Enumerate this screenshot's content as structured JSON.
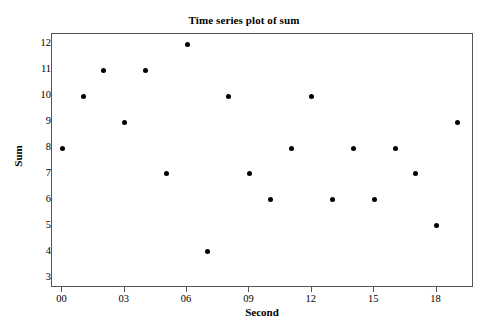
{
  "chart_data": {
    "type": "scatter",
    "title": "Time series plot of sum",
    "xlabel": "Second",
    "ylabel": "Sum",
    "xlim": [
      -0.5,
      19.8
    ],
    "ylim": [
      2.6,
      12.4
    ],
    "grid": false,
    "legend": null,
    "x_ticks": [
      "00",
      "03",
      "06",
      "09",
      "12",
      "15",
      "18"
    ],
    "x_tick_values": [
      0,
      3,
      6,
      9,
      12,
      15,
      18
    ],
    "y_ticks": [
      "3",
      "4",
      "5",
      "6",
      "7",
      "8",
      "9",
      "10",
      "11",
      "12"
    ],
    "y_tick_values": [
      3,
      4,
      5,
      6,
      7,
      8,
      9,
      10,
      11,
      12
    ],
    "marker": "filled-circle",
    "marker_color": "#000000",
    "x": [
      0,
      1,
      2,
      3,
      4,
      5,
      6,
      7,
      8,
      9,
      10,
      11,
      12,
      13,
      14,
      15,
      16,
      17,
      18,
      19
    ],
    "values": [
      8,
      10,
      11,
      9,
      11,
      7,
      12,
      4,
      10,
      7,
      6,
      8,
      10,
      6,
      8,
      6,
      8,
      7,
      5,
      9
    ],
    "points": [
      {
        "x": 0,
        "y": 8
      },
      {
        "x": 1,
        "y": 10
      },
      {
        "x": 2,
        "y": 11
      },
      {
        "x": 3,
        "y": 9
      },
      {
        "x": 4,
        "y": 11
      },
      {
        "x": 5,
        "y": 7
      },
      {
        "x": 6,
        "y": 12
      },
      {
        "x": 7,
        "y": 4
      },
      {
        "x": 8,
        "y": 10
      },
      {
        "x": 9,
        "y": 7
      },
      {
        "x": 10,
        "y": 6
      },
      {
        "x": 11,
        "y": 8
      },
      {
        "x": 12,
        "y": 10
      },
      {
        "x": 13,
        "y": 6
      },
      {
        "x": 14,
        "y": 8
      },
      {
        "x": 15,
        "y": 6
      },
      {
        "x": 16,
        "y": 8
      },
      {
        "x": 17,
        "y": 7
      },
      {
        "x": 18,
        "y": 5
      },
      {
        "x": 19,
        "y": 9
      }
    ]
  },
  "colors": {
    "background": "#ffffff",
    "frame": "#555555",
    "marker": "#000000",
    "text": "#000000"
  }
}
